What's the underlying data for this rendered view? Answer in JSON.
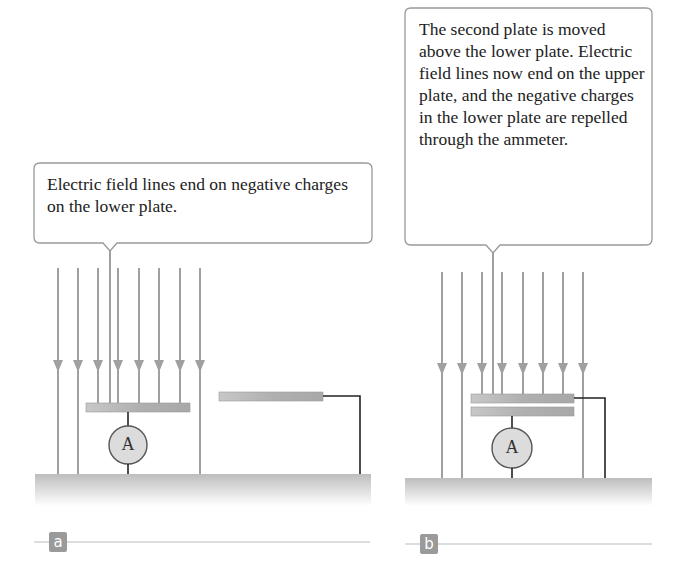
{
  "panels": [
    {
      "id": "a",
      "label": "a",
      "callout": "Electric field lines end on negative charges on the lower plate.",
      "ammeter_symbol": "A"
    },
    {
      "id": "b",
      "label": "b",
      "callout": "The second plate is moved above the lower plate. Electric field lines now end on the upper plate, and the negative charges in the lower plate are repelled through the ammeter.",
      "ammeter_symbol": "A"
    }
  ],
  "colors": {
    "field_line": "#a0a0a0",
    "plate": "#b5b5b5",
    "ground": "#c4c4c4",
    "ammeter_fill": "#dcdcdc",
    "wire": "#222222",
    "callout_border": "#999999",
    "label_bg": "#9a9a9a"
  }
}
